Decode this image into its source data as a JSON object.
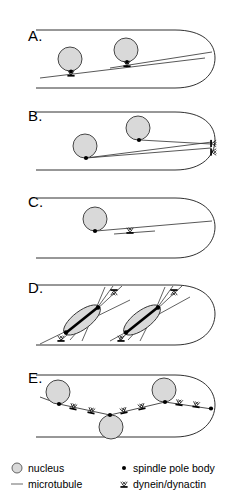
{
  "figure": {
    "panels": [
      {
        "id": "A",
        "label": "A.",
        "description": "Two interphase nuclei attached by spindle pole bodies to a microtubule, with dynein/dynactin at the attachment sites",
        "nuclei": 2,
        "spindle_pole_bodies": 2,
        "dynein_sites": 2
      },
      {
        "id": "B",
        "label": "B.",
        "description": "Nuclei with microtubules extending to the hyphal tip cortex where two dynein/dynactin complexes are anchored",
        "nuclei": 2,
        "spindle_pole_bodies": 2,
        "dynein_sites": 2
      },
      {
        "id": "C",
        "label": "C.",
        "description": "Single nucleus with spindle pole body and a short microtubule bearing one dynein/dynactin complex",
        "nuclei": 1,
        "spindle_pole_bodies": 1,
        "dynein_sites": 1
      },
      {
        "id": "D",
        "label": "D.",
        "description": "Two mitotic spindles with spindle pole bodies at each pole and astral microtubules reaching cortical dynein/dynactin",
        "nuclei": 2,
        "spindle_pole_bodies": 4,
        "dynein_sites": 4
      },
      {
        "id": "E",
        "label": "E.",
        "description": "Three nuclei spaced along a zigzag microtubule array with many dynein/dynactin motors between them",
        "nuclei": 3,
        "spindle_pole_bodies": 3,
        "dynein_sites": 8
      }
    ]
  },
  "legend": {
    "items": [
      {
        "icon": "nucleus-icon",
        "label": "nucleus"
      },
      {
        "icon": "microtubule-icon",
        "label": "microtubule"
      },
      {
        "icon": "spindle-pole-body-icon",
        "label": "spindle pole body"
      },
      {
        "icon": "dynein-dynactin-icon",
        "label": "dynein/dynactin"
      }
    ]
  },
  "colors": {
    "outline": "#1a1a1a",
    "nucleus_fill": "#d9d9d9",
    "nucleus_stroke": "#333333",
    "microtubule": "#444444",
    "spindle_pole_body": "#000000",
    "background": "#ffffff"
  }
}
